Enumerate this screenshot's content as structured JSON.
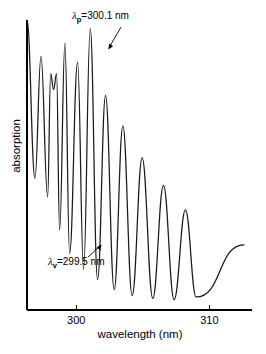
{
  "chart_data": {
    "type": "line",
    "title": "",
    "xlabel": "wavelength (nm)",
    "ylabel": "absorption",
    "xlim": [
      296.3,
      313.2
    ],
    "ylim": [
      0,
      1
    ],
    "grid": false,
    "legend": null,
    "xticks": [
      300,
      310
    ],
    "xticklabels": [
      "300",
      "310"
    ],
    "yticks": [],
    "yticklabels": [],
    "annotations": [
      {
        "name": "peak-label",
        "symbol": "λ",
        "subscript": "p",
        "equals": "=",
        "value": "300.1",
        "unit": "nm",
        "text": "λp = 300.1 nm",
        "points_to_x": 300.1,
        "points_to": "peak"
      },
      {
        "name": "valley-label",
        "symbol": "λ",
        "subscript": "v",
        "equals": "=",
        "value": "299.5",
        "unit": "nm",
        "text": "λv = 299.5 nm",
        "points_to_x": 299.5,
        "points_to": "valley"
      }
    ],
    "trace_color": "#1a1a1a",
    "axis_color": "#000000",
    "background": "#ffffff",
    "peaks": [
      {
        "x": 296.35,
        "y": 1.0
      },
      {
        "x": 297.35,
        "y": 0.875
      },
      {
        "x": 298.3,
        "y": 0.815
      },
      {
        "x": 299.15,
        "y": 0.92
      },
      {
        "x": 300.1,
        "y": 0.855
      },
      {
        "x": 301.05,
        "y": 0.97
      },
      {
        "x": 302.2,
        "y": 0.74
      },
      {
        "x": 303.5,
        "y": 0.635
      },
      {
        "x": 304.95,
        "y": 0.525
      },
      {
        "x": 306.55,
        "y": 0.43
      },
      {
        "x": 308.2,
        "y": 0.345
      }
    ],
    "valleys": [
      {
        "x": 296.9,
        "y": 0.455
      },
      {
        "x": 297.85,
        "y": 0.39
      },
      {
        "x": 298.75,
        "y": 0.275
      },
      {
        "x": 299.5,
        "y": 0.195
      },
      {
        "x": 300.55,
        "y": 0.14
      },
      {
        "x": 301.6,
        "y": 0.105
      },
      {
        "x": 302.85,
        "y": 0.07
      },
      {
        "x": 304.2,
        "y": 0.05
      },
      {
        "x": 305.75,
        "y": 0.04
      },
      {
        "x": 307.35,
        "y": 0.035
      },
      {
        "x": 309.0,
        "y": 0.045
      }
    ],
    "notch": {
      "on_peak_index": 2,
      "dip_depth": 0.055,
      "half_width": 0.22,
      "note": "third fringe peak is split by a small central notch"
    },
    "tail": {
      "x_end": 312.6,
      "y_end": 0.225,
      "note": "trace rises to a short plateau and ends"
    },
    "start": {
      "x": 296.3,
      "y": 1.0
    }
  }
}
